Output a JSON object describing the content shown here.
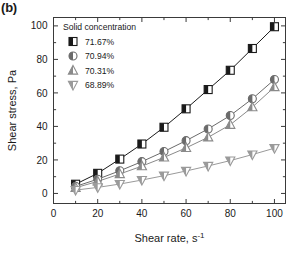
{
  "panel": {
    "label": "(b)"
  },
  "chart_data": {
    "type": "line",
    "title": "",
    "xlabel": "Shear rate, s",
    "xlabel_sup": "-1",
    "ylabel": "Shear stress, Pa",
    "xlim": [
      0,
      105
    ],
    "ylim": [
      -6,
      105
    ],
    "xticks": [
      0,
      20,
      40,
      60,
      80,
      100
    ],
    "yticks": [
      0,
      20,
      40,
      60,
      80,
      100
    ],
    "xminor": [
      10,
      30,
      50,
      70,
      90
    ],
    "yminor": [
      10,
      30,
      50,
      70,
      90
    ],
    "grid": false,
    "legend_position": "upper-left-inside",
    "legend_title": "Solid concentration",
    "x": [
      10,
      20,
      30,
      40,
      50,
      60,
      70,
      80,
      90,
      100
    ],
    "series": [
      {
        "name": "71.67%",
        "marker": "half-filled-square",
        "color": "#1a1a1a",
        "values": [
          5.5,
          12.0,
          20.5,
          29.5,
          39.5,
          50.5,
          62.0,
          73.5,
          86.5,
          99.5
        ]
      },
      {
        "name": "70.94%",
        "marker": "half-filled-circle",
        "color": "#6b6b6b",
        "values": [
          4.2,
          8.5,
          13.5,
          19.0,
          25.0,
          31.5,
          38.5,
          46.5,
          56.5,
          68.0
        ]
      },
      {
        "name": "70.31%",
        "marker": "half-filled-triangle-up",
        "color": "#8a8a8a",
        "values": [
          3.4,
          7.2,
          11.6,
          16.3,
          21.5,
          27.2,
          33.5,
          41.0,
          51.5,
          63.5
        ]
      },
      {
        "name": "68.89%",
        "marker": "half-filled-triangle-down",
        "color": "#9a9a9a",
        "values": [
          2.0,
          3.6,
          5.6,
          8.0,
          10.6,
          13.4,
          16.4,
          19.6,
          23.2,
          27.0
        ]
      }
    ]
  }
}
